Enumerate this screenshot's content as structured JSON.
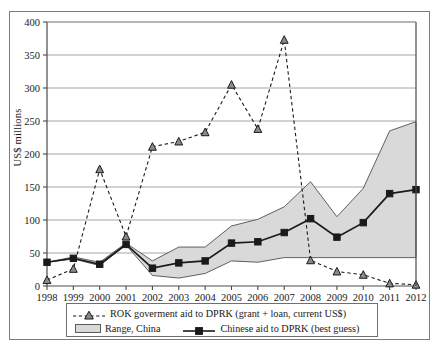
{
  "figure": {
    "ylabel": "US$ millions",
    "frame_color": "#7d7d7d",
    "range_fill": "#d9d9d9",
    "line_color": "#1a1a1a"
  },
  "legend": {
    "items": [
      {
        "label": "ROK goverment aid to DPRK (grant + loan, current US$)",
        "marker": "triangle-dashed"
      },
      {
        "label": "Range, China",
        "marker": "area-swatch"
      },
      {
        "label": "Chinese aid to DPRK (best guess)",
        "marker": "square-solid"
      }
    ]
  },
  "chart_data": {
    "type": "line",
    "title": "",
    "xlabel": "",
    "ylabel": "US$ millions",
    "ylim": [
      0,
      400
    ],
    "yticks": [
      0,
      50,
      100,
      150,
      200,
      250,
      300,
      350,
      400
    ],
    "grid": true,
    "legend_position": "below",
    "categories": [
      1998,
      1999,
      2000,
      2001,
      2002,
      2003,
      2004,
      2005,
      2006,
      2007,
      2008,
      2009,
      2010,
      2011,
      2012
    ],
    "xticklabels": [
      "1998",
      "1999",
      "2000",
      "2001",
      "2002",
      "2003",
      "2004",
      "2005",
      "2006",
      "2007",
      "2008",
      "2009",
      "2010",
      "2011",
      "2012"
    ],
    "series": [
      {
        "name": "ROK goverment aid to DPRK (grant + loan, current US$)",
        "style": "dashed",
        "marker": "triangle",
        "values": [
          9,
          26,
          177,
          75,
          211,
          219,
          233,
          305,
          238,
          373,
          39,
          22,
          17,
          4,
          2
        ]
      },
      {
        "name": "Chinese aid to DPRK (best guess)",
        "style": "solid",
        "marker": "square",
        "values": [
          36,
          42,
          33,
          63,
          27,
          35,
          38,
          65,
          67,
          81,
          102,
          74,
          96,
          140,
          146
        ]
      },
      {
        "name": "Range, China (upper)",
        "style": "band-upper",
        "marker": "none",
        "values": [
          36,
          44,
          36,
          65,
          38,
          59,
          59,
          91,
          101,
          120,
          158,
          105,
          148,
          235,
          249
        ]
      },
      {
        "name": "Range, China (lower)",
        "style": "band-lower",
        "marker": "none",
        "values": [
          36,
          41,
          31,
          62,
          16,
          12,
          19,
          38,
          36,
          43,
          43,
          43,
          43,
          43,
          43
        ]
      }
    ]
  }
}
